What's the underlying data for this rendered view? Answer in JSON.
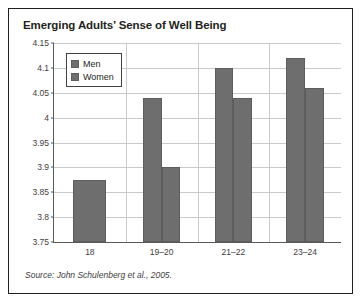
{
  "figure": {
    "title": "Emerging Adults’ Sense of Well Being",
    "source": "Source: John Schulenberg et al., 2005."
  },
  "legend": {
    "items": [
      {
        "label": "Men",
        "color": "#6e6e6e"
      },
      {
        "label": "Women",
        "color": "#6e6e6e"
      }
    ]
  },
  "axis": {
    "y_ticks": [
      "4.15",
      "4.1",
      "4.05",
      "4",
      "3.95",
      "3.9",
      "3.85",
      "3.8",
      "3.75"
    ],
    "x_ticks": [
      "18",
      "19–20",
      "21–22",
      "23–24"
    ]
  },
  "chart_data": {
    "type": "bar",
    "title": "Emerging Adults’ Sense of Well Being",
    "xlabel": "",
    "ylabel": "",
    "ylim": [
      3.75,
      4.15
    ],
    "ytick_step": 0.05,
    "grid": true,
    "legend_position": "top-left-inside",
    "categories": [
      "18",
      "19–20",
      "21–22",
      "23–24"
    ],
    "series": [
      {
        "name": "Men",
        "color": "#6e6e6e",
        "values": [
          3.875,
          4.04,
          4.1,
          4.12
        ]
      },
      {
        "name": "Women",
        "color": "#6e6e6e",
        "values": [
          null,
          3.9,
          4.04,
          4.06
        ]
      }
    ],
    "source": "Source: John Schulenberg et al., 2005."
  }
}
